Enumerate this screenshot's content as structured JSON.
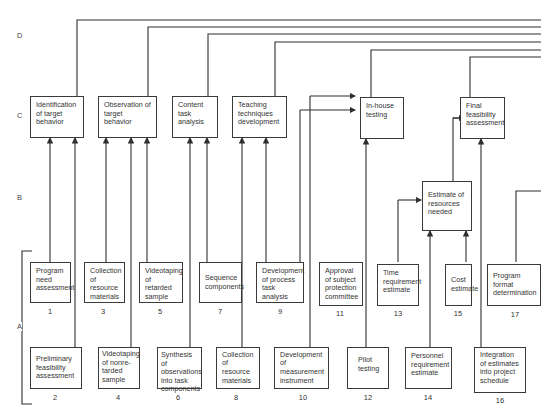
{
  "row_labels": {
    "d": "D",
    "c": "C",
    "b": "B",
    "a": "A"
  },
  "level_c": [
    {
      "label": "Identification of target behavior"
    },
    {
      "label": "Observation of target behavior"
    },
    {
      "label": "Content task analysis"
    },
    {
      "label": "Teaching techniques development"
    },
    {
      "label": "In-house testing"
    },
    {
      "label": "Final feasibility assessment"
    }
  ],
  "level_b": [
    {
      "label": "Estimate of resources needed"
    }
  ],
  "level_a_upper": [
    {
      "label": "Program need assessment",
      "number": "1"
    },
    {
      "label": "Collection of resource materials",
      "number": "3"
    },
    {
      "label": "Videotaping of retarded sample",
      "number": "5"
    },
    {
      "label": "Sequence components",
      "number": "7"
    },
    {
      "label": "Development of process task analysis",
      "number": "9"
    },
    {
      "label": "Approval of subject protection committee",
      "number": "11"
    },
    {
      "label": "Time requirement estimate",
      "number": "13"
    },
    {
      "label": "Cost estimate",
      "number": "15"
    },
    {
      "label": "Program format determination",
      "number": "17"
    }
  ],
  "level_a_lower": [
    {
      "label": "Preliminary feasibility assessment",
      "number": "2"
    },
    {
      "label": "Videotaping of nonre-tarded sample",
      "number": "4"
    },
    {
      "label": "Synthesis of observations into task components",
      "number": "6"
    },
    {
      "label": "Collection of resource materials",
      "number": "8"
    },
    {
      "label": "Development of measurement instrument",
      "number": "10"
    },
    {
      "label": "Pilot testing",
      "number": "12"
    },
    {
      "label": "Personnel requirement estimate",
      "number": "14"
    },
    {
      "label": "Integration of estimates into project schedule",
      "number": "16"
    }
  ],
  "colors": {
    "line": "#2f2f2f",
    "text": "#333333",
    "background": "#ffffff"
  }
}
